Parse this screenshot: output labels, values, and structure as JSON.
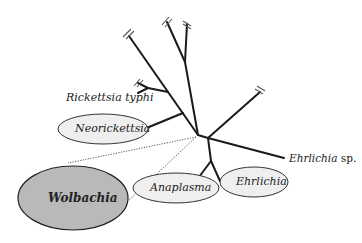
{
  "diagram": {
    "type": "phylogenetic-tree",
    "colors": {
      "line": "#1a1a1a",
      "ellipse_fill": "#efefef",
      "ellipse_stroke": "#333333",
      "wolbachia_fill": "#b9b9b9",
      "text": "#222222"
    },
    "labels": {
      "rickettsia_typhi": "Rickettsia typhi",
      "neorickettsia": "Neorickettsia",
      "wolbachia": "Wolbachia",
      "anaplasma": "Anaplasma",
      "ehrlichia": "Ehrlichia",
      "ehrlichia_sp_genus": "Ehrlichia",
      "ehrlichia_sp_suffix": " sp."
    }
  }
}
